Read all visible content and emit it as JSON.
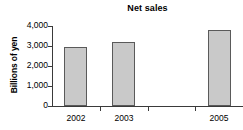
{
  "chart_data": {
    "type": "bar",
    "title": "Net sales",
    "xlabel": "",
    "ylabel": "Billions of yen",
    "categories": [
      "2002",
      "2003",
      "",
      "2005"
    ],
    "values": [
      2950,
      3200,
      null,
      3800
    ],
    "ylim": [
      0,
      4000
    ],
    "yticks": [
      0,
      1000,
      2000,
      3000,
      4000
    ],
    "ytick_labels": [
      "0",
      "1,000",
      "2,000",
      "3,000",
      "4,000"
    ],
    "grid": false,
    "legend": "none",
    "bar_fill_color": "#c9c9c9",
    "bar_border_color": "#5a5a5a",
    "axis_color": "#3a3a3a",
    "text_color": "#000000",
    "background_color": "#ffffff"
  }
}
